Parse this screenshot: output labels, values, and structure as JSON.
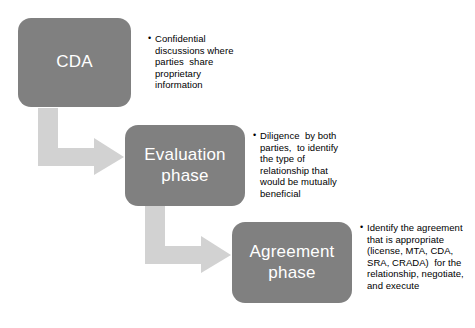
{
  "diagram": {
    "colors": {
      "box_fill": "#808080",
      "box_text": "#ffffff",
      "arrow_fill": "#d2d2d2",
      "background": "#ffffff",
      "bullet_text": "#000000"
    },
    "stages": [
      {
        "id": "cda",
        "label": "CDA",
        "bullets": [
          "Confidential discussions where parties  share proprietary information"
        ]
      },
      {
        "id": "evaluation",
        "label": "Evaluation phase",
        "bullets": [
          "Diligence  by both parties,  to identify the type of relationship that would be mutually beneficial"
        ]
      },
      {
        "id": "agreement",
        "label": "Agreement phase",
        "bullets": [
          "Identify the agreement that is appropriate (license, MTA, CDA, SRA, CRADA)  for the relationship, negotiate, and execute"
        ]
      }
    ],
    "connectors": [
      {
        "id": "cda-to-evaluation",
        "shape": "elbow-down-right-arrow"
      },
      {
        "id": "evaluation-to-agreement",
        "shape": "elbow-down-right-arrow"
      }
    ]
  }
}
